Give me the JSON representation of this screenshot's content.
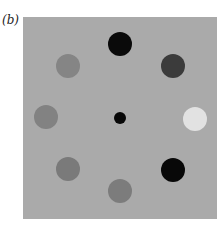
{
  "figure": {
    "label": "(b)",
    "background": "#aaaaaa",
    "circles": [
      {
        "name": "top",
        "cx": 120,
        "cy": 44,
        "r": 12,
        "color": "#0a0a0a"
      },
      {
        "name": "top-right",
        "cx": 173,
        "cy": 66,
        "r": 12,
        "color": "#3b3b3b"
      },
      {
        "name": "right",
        "cx": 195,
        "cy": 119,
        "r": 12,
        "color": "#e2e2e2"
      },
      {
        "name": "bottom-right",
        "cx": 173,
        "cy": 170,
        "r": 12,
        "color": "#080808"
      },
      {
        "name": "bottom",
        "cx": 120,
        "cy": 191,
        "r": 12,
        "color": "#7c7c7c"
      },
      {
        "name": "bottom-left",
        "cx": 68,
        "cy": 169,
        "r": 12,
        "color": "#7a7a7a"
      },
      {
        "name": "left",
        "cx": 46,
        "cy": 117,
        "r": 12,
        "color": "#828282"
      },
      {
        "name": "top-left",
        "cx": 68,
        "cy": 66,
        "r": 12,
        "color": "#858585"
      },
      {
        "name": "center-fixation",
        "cx": 120,
        "cy": 118,
        "r": 6,
        "color": "#080808"
      }
    ]
  }
}
